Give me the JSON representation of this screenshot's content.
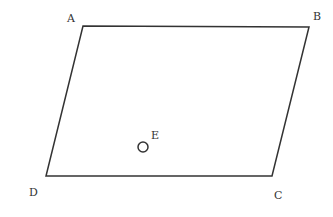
{
  "diagram": {
    "type": "parallelogram",
    "stroke_color": "#333333",
    "background": "#ffffff",
    "vertices": [
      {
        "label": "A",
        "x": 83,
        "y": 26,
        "label_x": 67,
        "label_y": 22
      },
      {
        "label": "B",
        "x": 309,
        "y": 27,
        "label_x": 313,
        "label_y": 20
      },
      {
        "label": "C",
        "x": 272,
        "y": 176,
        "label_x": 274,
        "label_y": 199
      },
      {
        "label": "D",
        "x": 46,
        "y": 176,
        "label_x": 29,
        "label_y": 196
      }
    ],
    "point_e": {
      "label": "E",
      "cx": 143,
      "cy": 147,
      "r": 5,
      "label_x": 151,
      "label_y": 139
    }
  }
}
